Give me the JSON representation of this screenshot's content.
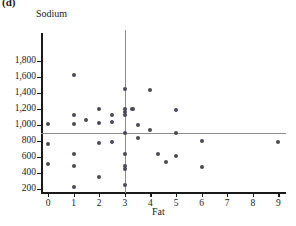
{
  "panel": {
    "label": "(d)"
  },
  "chart_data": {
    "type": "scatter",
    "title": "",
    "xlabel": "Fat",
    "ylabel": "Sodium",
    "xlim": [
      -0.35,
      9.6
    ],
    "ylim": [
      100,
      1900
    ],
    "grid": false,
    "legend": null,
    "xticks": [
      0,
      1,
      2,
      3,
      4,
      5,
      6,
      7,
      8,
      9
    ],
    "xtick_labels": [
      "0",
      "1",
      "2",
      "3",
      "4",
      "5",
      "6",
      "7",
      "8",
      "9"
    ],
    "yticks": [
      200,
      400,
      600,
      800,
      1000,
      1200,
      1400,
      1600,
      1800
    ],
    "ytick_labels": [
      "200",
      "400",
      "600",
      "800",
      "1,000",
      "1,200",
      "1,400",
      "1,600",
      "1,800"
    ],
    "reference_lines": [
      {
        "orientation": "horizontal",
        "value": 900,
        "color": "#8c8c8c"
      },
      {
        "orientation": "vertical",
        "value": 3,
        "color": "#8c8c8c"
      }
    ],
    "marker_color": "#4a4a55",
    "points": [
      {
        "x": 0,
        "y": 1010
      },
      {
        "x": 0,
        "y": 760
      },
      {
        "x": 0,
        "y": 510
      },
      {
        "x": 1,
        "y": 1620
      },
      {
        "x": 1,
        "y": 1130
      },
      {
        "x": 1,
        "y": 1010
      },
      {
        "x": 1,
        "y": 640
      },
      {
        "x": 1,
        "y": 490
      },
      {
        "x": 1,
        "y": 230
      },
      {
        "x": 1.5,
        "y": 1060
      },
      {
        "x": 2,
        "y": 1200
      },
      {
        "x": 2,
        "y": 1030
      },
      {
        "x": 2,
        "y": 780
      },
      {
        "x": 2,
        "y": 355
      },
      {
        "x": 2.5,
        "y": 1130
      },
      {
        "x": 2.5,
        "y": 1040
      },
      {
        "x": 2.5,
        "y": 790
      },
      {
        "x": 3,
        "y": 1450
      },
      {
        "x": 3,
        "y": 1200
      },
      {
        "x": 3,
        "y": 1160
      },
      {
        "x": 3,
        "y": 1120
      },
      {
        "x": 3,
        "y": 900
      },
      {
        "x": 3,
        "y": 640
      },
      {
        "x": 3,
        "y": 490
      },
      {
        "x": 3,
        "y": 450
      },
      {
        "x": 3,
        "y": 245
      },
      {
        "x": 3.3,
        "y": 1200
      },
      {
        "x": 3.5,
        "y": 1000
      },
      {
        "x": 3.5,
        "y": 840
      },
      {
        "x": 4,
        "y": 1440
      },
      {
        "x": 4,
        "y": 940
      },
      {
        "x": 4.3,
        "y": 640
      },
      {
        "x": 4.6,
        "y": 540
      },
      {
        "x": 5,
        "y": 1190
      },
      {
        "x": 5,
        "y": 900
      },
      {
        "x": 5,
        "y": 610
      },
      {
        "x": 6,
        "y": 800
      },
      {
        "x": 6,
        "y": 480
      },
      {
        "x": 9,
        "y": 790
      }
    ]
  }
}
